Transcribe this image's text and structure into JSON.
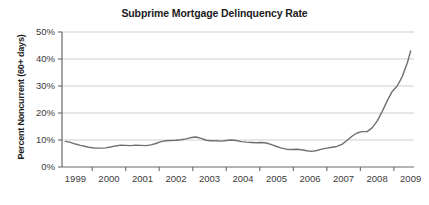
{
  "chart_data": {
    "type": "line",
    "title": "Subprime Mortgage Delinquency Rate",
    "xlabel": "",
    "ylabel": "Percent Noncurrent (60+ days)",
    "xlim": [
      1998.6,
      2009.1
    ],
    "ylim": [
      0,
      50
    ],
    "grid": true,
    "grid_axis": "y",
    "legend": false,
    "line_color": "#6f6f6f",
    "y_tick_labels": [
      "0%",
      "10%",
      "20%",
      "30%",
      "40%",
      "50%"
    ],
    "y_tick_values": [
      0,
      10,
      20,
      30,
      40,
      50
    ],
    "x_tick_labels": [
      "1999",
      "2000",
      "2001",
      "2002",
      "2003",
      "2004",
      "2005",
      "2006",
      "2007",
      "2008",
      "2009"
    ],
    "x_tick_values": [
      1999,
      2000,
      2001,
      2002,
      2003,
      2004,
      2005,
      2006,
      2007,
      2008,
      2009
    ],
    "series": [
      {
        "name": "Percent Noncurrent (60+ days)",
        "x": [
          1998.7,
          1998.85,
          1999.0,
          1999.15,
          1999.3,
          1999.45,
          1999.6,
          1999.75,
          1999.9,
          2000.05,
          2000.2,
          2000.35,
          2000.5,
          2000.65,
          2000.8,
          2000.95,
          2001.1,
          2001.25,
          2001.4,
          2001.55,
          2001.7,
          2001.85,
          2002.0,
          2002.15,
          2002.3,
          2002.45,
          2002.6,
          2002.75,
          2002.9,
          2003.05,
          2003.2,
          2003.35,
          2003.5,
          2003.65,
          2003.8,
          2003.95,
          2004.1,
          2004.25,
          2004.4,
          2004.55,
          2004.7,
          2004.85,
          2005.0,
          2005.15,
          2005.3,
          2005.45,
          2005.6,
          2005.75,
          2005.9,
          2006.05,
          2006.2,
          2006.35,
          2006.5,
          2006.65,
          2006.8,
          2006.95,
          2007.1,
          2007.25,
          2007.4,
          2007.55,
          2007.7,
          2007.85,
          2008.0,
          2008.15,
          2008.3,
          2008.45,
          2008.6,
          2008.75,
          2008.9,
          2009.0
        ],
        "y": [
          9.5,
          9.1,
          8.5,
          8.0,
          7.6,
          7.2,
          7.0,
          7.0,
          7.1,
          7.4,
          7.8,
          8.1,
          8.0,
          7.9,
          8.1,
          8.0,
          7.9,
          8.2,
          8.7,
          9.4,
          9.7,
          9.8,
          9.9,
          10.1,
          10.4,
          10.9,
          11.1,
          10.6,
          9.9,
          9.7,
          9.7,
          9.6,
          9.8,
          10.0,
          9.8,
          9.4,
          9.2,
          9.1,
          9.0,
          9.1,
          8.9,
          8.3,
          7.6,
          7.0,
          6.6,
          6.5,
          6.6,
          6.4,
          6.0,
          5.8,
          6.1,
          6.6,
          7.0,
          7.3,
          7.6,
          8.4,
          9.8,
          11.4,
          12.6,
          13.1,
          13.1,
          14.5,
          17.0,
          20.5,
          24.5,
          28.0,
          30.0,
          33.5,
          38.5,
          43.0
        ]
      }
    ],
    "annotations": []
  }
}
